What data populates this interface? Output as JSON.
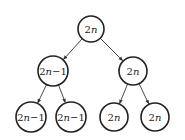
{
  "diagram": {
    "type": "binary-tree",
    "colors": {
      "stroke": "#222222",
      "background": "#ffffff",
      "text": "#222222"
    },
    "nodes": [
      {
        "id": "root",
        "label": "2n",
        "cx": 91,
        "cy": 29,
        "r": 13
      },
      {
        "id": "l",
        "label": "2n−1",
        "cx": 53,
        "cy": 71,
        "r": 15
      },
      {
        "id": "r",
        "label": "2n",
        "cx": 133,
        "cy": 71,
        "r": 14
      },
      {
        "id": "ll",
        "label": "2n−1",
        "cx": 31,
        "cy": 117,
        "r": 15
      },
      {
        "id": "lr",
        "label": "2n−1",
        "cx": 71,
        "cy": 117,
        "r": 15
      },
      {
        "id": "rl",
        "label": "2n",
        "cx": 114,
        "cy": 117,
        "r": 14
      },
      {
        "id": "rr",
        "label": "2n",
        "cx": 155,
        "cy": 117,
        "r": 14
      }
    ],
    "edges": [
      {
        "from": "root",
        "to": "l"
      },
      {
        "from": "root",
        "to": "r"
      },
      {
        "from": "l",
        "to": "ll"
      },
      {
        "from": "l",
        "to": "lr"
      },
      {
        "from": "r",
        "to": "rl"
      },
      {
        "from": "r",
        "to": "rr"
      }
    ]
  }
}
